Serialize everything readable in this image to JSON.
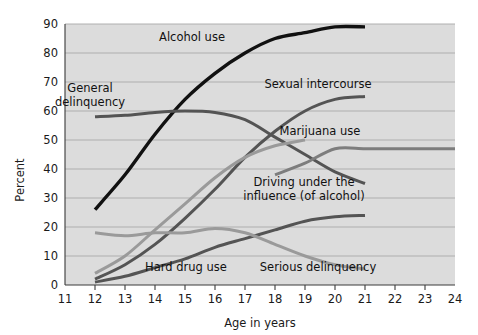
{
  "chart_data": {
    "type": "line",
    "title": "",
    "xlabel": "Age in years",
    "ylabel": "Percent",
    "xlim": [
      11,
      24
    ],
    "ylim": [
      0,
      90
    ],
    "grid": true,
    "legend_position": "inline-annotations",
    "x_ticks": [
      "11",
      "12",
      "13",
      "14",
      "15",
      "16",
      "17",
      "18",
      "19",
      "20",
      "21",
      "22",
      "23",
      "24"
    ],
    "y_ticks": [
      "0",
      "10",
      "20",
      "30",
      "40",
      "50",
      "60",
      "70",
      "80",
      "90"
    ],
    "series": [
      {
        "name": "Alcohol use",
        "color": "#111111",
        "width": 3.4,
        "x": [
          12,
          13,
          14,
          15,
          16,
          17,
          18,
          19,
          20,
          21
        ],
        "values": [
          26,
          38,
          52,
          64,
          73,
          80,
          85,
          87,
          89,
          89
        ]
      },
      {
        "name": "General delinquency",
        "color": "#545454",
        "width": 3.0,
        "x": [
          12,
          13,
          14,
          15,
          16,
          17,
          18,
          19,
          20,
          21
        ],
        "values": [
          58,
          58.5,
          59.5,
          60,
          59.5,
          57,
          51,
          45,
          39,
          35
        ]
      },
      {
        "name": "Sexual intercourse",
        "color": "#545454",
        "width": 3.0,
        "x": [
          12,
          13,
          14,
          15,
          16,
          17,
          18,
          19,
          20,
          21
        ],
        "values": [
          2,
          7,
          14,
          23,
          33,
          44,
          53,
          60,
          64,
          65
        ]
      },
      {
        "name": "Marijuana use",
        "color": "#9a9a9a",
        "width": 3.0,
        "x": [
          12,
          13,
          14,
          15,
          16,
          17,
          18,
          19
        ],
        "values": [
          4,
          10,
          19,
          28,
          37,
          44,
          48,
          50
        ]
      },
      {
        "name": "Driving under the influence (of alcohol)",
        "color": "#7d7d7d",
        "width": 3.0,
        "x": [
          18,
          19,
          20,
          21,
          22,
          23,
          24
        ],
        "values": [
          38,
          42,
          47,
          47,
          47,
          47,
          47
        ]
      },
      {
        "name": "Hard drug use",
        "color": "#545454",
        "width": 3.0,
        "x": [
          12,
          13,
          14,
          15,
          16,
          17,
          18,
          19,
          20,
          21
        ],
        "values": [
          1,
          3,
          6,
          9,
          13,
          16,
          19,
          22,
          23.5,
          24
        ]
      },
      {
        "name": "Serious delinquency",
        "color": "#9a9a9a",
        "width": 3.0,
        "x": [
          12,
          13,
          14,
          15,
          16,
          17,
          18,
          19,
          20,
          21
        ],
        "values": [
          18,
          17,
          18,
          18,
          19.5,
          18,
          14,
          10,
          7,
          5.5
        ]
      }
    ],
    "annotations": [
      {
        "name": "alcohol-use",
        "text": "Alcohol use",
        "x": 192,
        "y": 41,
        "lines": [
          "Alcohol use"
        ]
      },
      {
        "name": "general-delinquency",
        "text": "General delinquency",
        "x": 90,
        "y": 92,
        "lines": [
          "General",
          "delinquency"
        ]
      },
      {
        "name": "sexual-intercourse",
        "text": "Sexual intercourse",
        "x": 318,
        "y": 88,
        "lines": [
          "Sexual intercourse"
        ]
      },
      {
        "name": "marijuana-use",
        "text": "Marijuana use",
        "x": 320,
        "y": 135,
        "lines": [
          "Marijuana use"
        ]
      },
      {
        "name": "driving-under-influence",
        "text": "Driving under the influence (of alcohol)",
        "x": 304,
        "y": 186,
        "lines": [
          "Driving under the",
          "influence (of alcohol)"
        ]
      },
      {
        "name": "hard-drug-use",
        "text": "Hard drug use",
        "x": 186,
        "y": 271,
        "lines": [
          "Hard drug use"
        ]
      },
      {
        "name": "serious-delinquency",
        "text": "Serious delinquency",
        "x": 318,
        "y": 271,
        "lines": [
          "Serious delinquency"
        ]
      }
    ]
  },
  "axes": {
    "y_axis_title": "Percent",
    "x_axis_title": "Age in years"
  },
  "colors": {
    "plot_background": "#dcdcdc",
    "gridline": "#a8a8a8",
    "axis": "#3a3a3a",
    "text": "#1a1a1a"
  }
}
